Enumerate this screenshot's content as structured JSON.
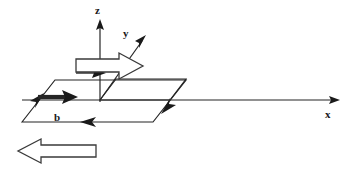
{
  "figure": {
    "background_color": "#ffffff",
    "line_color": "#252525",
    "label_color": "#1a1a1a",
    "width": 351,
    "height": 172
  },
  "axes": {
    "origin": {
      "x": 100,
      "y": 100
    },
    "items": [
      {
        "name": "z",
        "label": "z",
        "label_x": 95,
        "label_y": 14,
        "from_x": 100,
        "from_y": 100,
        "to_x": 100,
        "to_y": 19
      },
      {
        "name": "y",
        "label": "y",
        "label_x": 123,
        "label_y": 37,
        "from_x": 100,
        "from_y": 100,
        "to_x": 146,
        "to_y": 35
      },
      {
        "name": "x",
        "label": "x",
        "label_x": 325,
        "label_y": 118,
        "from_x": 100,
        "from_y": 100,
        "to_x": 340,
        "to_y": 100
      }
    ]
  },
  "slip_plane": {
    "name": "slip-plane-parallelogram",
    "vertices": "22,122 55,80 186,80 153,122",
    "edge_arrows": [
      {
        "name": "left-edge-arrow",
        "direction": "up-right"
      },
      {
        "name": "bottom-edge-arrow",
        "direction": "left"
      },
      {
        "name": "right-edge-arrow",
        "direction": "down-left"
      }
    ]
  },
  "inner_plane": {
    "name": "inner-slipped-region",
    "vertices": "100,100 116,79 186,79 170,100"
  },
  "burgers_vector": {
    "name": "burgers-vector",
    "label": "b",
    "label_x": 54,
    "label_y": 120,
    "from_x": 36,
    "from_y": 97,
    "to_x": 75,
    "to_y": 97
  },
  "hollow_arrows": [
    {
      "name": "dislocation-motion-arrow",
      "label": "",
      "direction": "right",
      "x": 76,
      "y": 53,
      "width": 67,
      "height": 26
    },
    {
      "name": "applied-shear-arrow",
      "label": "",
      "direction": "left",
      "x": 18,
      "y": 139,
      "width": 78,
      "height": 24
    }
  ],
  "small_solid_arrow": {
    "name": "origin-marker-arrow",
    "direction": "right",
    "from_x": 82,
    "from_y": 73,
    "to_x": 104,
    "to_y": 73
  }
}
